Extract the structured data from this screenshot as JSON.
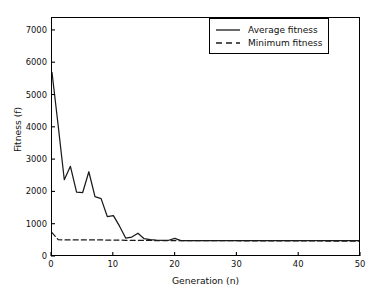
{
  "chart_data": {
    "type": "line",
    "title": "",
    "xlabel": "Generation (n)",
    "ylabel": "Fitness (f)",
    "xlim": [
      0,
      50
    ],
    "ylim": [
      0,
      7400
    ],
    "xticks": [
      0,
      10,
      20,
      30,
      40,
      50
    ],
    "yticks": [
      0,
      1000,
      2000,
      3000,
      4000,
      5000,
      6000,
      7000
    ],
    "grid": false,
    "legend_position": "upper right",
    "x": [
      0,
      1,
      2,
      3,
      4,
      5,
      6,
      7,
      8,
      9,
      10,
      11,
      12,
      13,
      14,
      15,
      16,
      17,
      18,
      19,
      20,
      21,
      22,
      23,
      24,
      25,
      26,
      27,
      28,
      29,
      30,
      31,
      32,
      33,
      34,
      35,
      36,
      37,
      38,
      39,
      40,
      41,
      42,
      43,
      44,
      45,
      46,
      47,
      48,
      49,
      50
    ],
    "series": [
      {
        "name": "Average fitness",
        "style": "solid",
        "color": "#1a1a1a",
        "values": [
          5700,
          4050,
          2350,
          2770,
          1960,
          1950,
          2600,
          1820,
          1760,
          1200,
          1230,
          900,
          530,
          560,
          680,
          510,
          480,
          465,
          460,
          460,
          520,
          450,
          450,
          450,
          450,
          450,
          450,
          450,
          450,
          450,
          450,
          450,
          450,
          450,
          450,
          450,
          450,
          450,
          450,
          450,
          450,
          450,
          450,
          450,
          450,
          450,
          450,
          450,
          450,
          450,
          450
        ]
      },
      {
        "name": "Minimum fitness",
        "style": "dashed",
        "color": "#1a1a1a",
        "values": [
          700,
          480,
          470,
          470,
          470,
          470,
          470,
          470,
          470,
          465,
          465,
          465,
          460,
          460,
          460,
          455,
          455,
          450,
          450,
          450,
          450,
          448,
          448,
          448,
          448,
          445,
          445,
          445,
          445,
          445,
          445,
          443,
          443,
          443,
          443,
          440,
          440,
          440,
          440,
          440,
          440,
          438,
          438,
          438,
          438,
          435,
          435,
          435,
          435,
          433,
          430
        ]
      }
    ]
  },
  "legend": {
    "entries": [
      {
        "label": "Average fitness",
        "style": "solid"
      },
      {
        "label": "Minimum fitness",
        "style": "dashed"
      }
    ]
  },
  "axes": {
    "x_tick_labels": [
      "0",
      "10",
      "20",
      "30",
      "40",
      "50"
    ],
    "y_tick_labels": [
      "0",
      "1000",
      "2000",
      "3000",
      "4000",
      "5000",
      "6000",
      "7000"
    ],
    "x_title": "Generation (n)",
    "y_title": "Fitness (f)"
  }
}
